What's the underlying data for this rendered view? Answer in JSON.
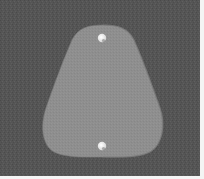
{
  "image": {
    "description": "Grayscale photo of a rounded trapezoidal (teardrop) plate with two small holes on a dark textured background",
    "colors": {
      "background": "#555555",
      "background_dark": "#4a4a4a",
      "plate": "#8e8e8e",
      "plate_highlight": "#9a9a9a",
      "plate_shadow": "#7a7a7a",
      "hole": "#f2f2f2",
      "border": "#ffffff"
    },
    "plate": {
      "top_y": 25,
      "bottom_y": 157,
      "left_x": 44,
      "right_x": 162
    },
    "holes": [
      {
        "cx": 102,
        "cy": 38,
        "r": 4
      },
      {
        "cx": 102,
        "cy": 146,
        "r": 4
      }
    ]
  }
}
